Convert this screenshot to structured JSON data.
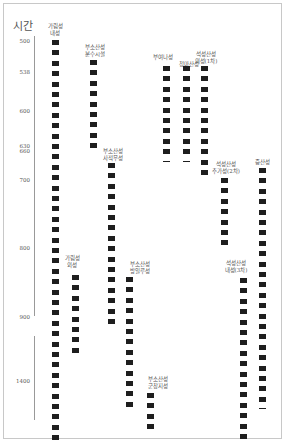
{
  "chart_data": {
    "type": "timeline",
    "title": "",
    "ylabel": "시간",
    "y_ticks": [
      "500",
      "538",
      "600",
      "630",
      "660",
      "700",
      "800",
      "900",
      "1400"
    ],
    "axis_break": "between 900 and 1400",
    "grid": false,
    "legend": null,
    "series": [
      {
        "name": "가림성 내성",
        "start": 500,
        "end": "~1450",
        "end_marker": "none"
      },
      {
        "name": "부소산성 분수시설",
        "start": 538,
        "end": 660,
        "end_marker": "none"
      },
      {
        "name": "부소산성 사적무성",
        "start": 670,
        "end": 900,
        "end_marker": "none"
      },
      {
        "name": "가림성 외성",
        "start": 840,
        "end": 920,
        "end_marker": "none"
      },
      {
        "name": "부소산성 방일루성",
        "start": 840,
        "end": "~1400",
        "end_marker": "none"
      },
      {
        "name": "부소산성 군창지성",
        "start": "~1410",
        "end": "~1450",
        "end_marker": "none"
      },
      {
        "name": "부여나성",
        "start": 538,
        "end": 660,
        "end_marker": "line"
      },
      {
        "name": "청마산성",
        "start": 538,
        "end": 660,
        "end_marker": "line"
      },
      {
        "name": "석성산성 외성(1차)",
        "start": 538,
        "end": 680,
        "end_marker": "none"
      },
      {
        "name": "석성산성 추가성(2차)",
        "start": 700,
        "end": 840,
        "end_marker": "none"
      },
      {
        "name": "석성산성 내성(3차)",
        "start": 850,
        "end": "~1450",
        "end_marker": "none"
      },
      {
        "name": "증산성",
        "start": 680,
        "end": "~1440",
        "end_marker": "line"
      }
    ]
  },
  "axis": {
    "title": "시간",
    "ticks": [
      {
        "label": "500",
        "y": 38
      },
      {
        "label": "538",
        "y": 69
      },
      {
        "label": "600",
        "y": 108
      },
      {
        "label": "630",
        "y": 143
      },
      {
        "label": "660",
        "y": 148
      },
      {
        "label": "700",
        "y": 177
      },
      {
        "label": "800",
        "y": 245
      },
      {
        "label": "900",
        "y": 314
      },
      {
        "label": "1400",
        "y": 378
      }
    ]
  },
  "columns": [
    {
      "label": "가림성\n내성",
      "x": 52,
      "label_x": 55,
      "label_y": 23,
      "start_y": 40,
      "count": 39,
      "end_line": false
    },
    {
      "label": "부소산성\n분수시설",
      "x": 90,
      "label_x": 95,
      "label_y": 44,
      "start_y": 60,
      "count": 9,
      "end_line": false
    },
    {
      "label": "부소산성\n사적무성",
      "x": 108,
      "label_x": 113,
      "label_y": 148,
      "start_y": 163,
      "count": 16,
      "end_line": false
    },
    {
      "label": "가림성\n외성",
      "x": 72,
      "label_x": 72,
      "label_y": 255,
      "start_y": 275,
      "count": 8,
      "end_line": false
    },
    {
      "label": "부소산성\n방일루성",
      "x": 126,
      "label_x": 140,
      "label_y": 261,
      "start_y": 277,
      "count": 13,
      "end_line": false
    },
    {
      "label": "부소산성\n군창지성",
      "x": 147,
      "label_x": 158,
      "label_y": 376,
      "start_y": 393,
      "count": 4,
      "end_line": false
    },
    {
      "label": "부여나성",
      "x": 163,
      "label_x": 163,
      "label_y": 54,
      "start_y": 66,
      "count": 9,
      "end_line": true
    },
    {
      "label": "청마산성",
      "x": 183,
      "label_x": 189,
      "label_y": 61,
      "start_y": 66,
      "count": 9,
      "end_line": true
    },
    {
      "label": "석성산성\n외성(1차)",
      "x": 201,
      "label_x": 206,
      "label_y": 51,
      "start_y": 66,
      "count": 11,
      "end_line": false
    },
    {
      "label": "석성산성\n추가성(2차)",
      "x": 221,
      "label_x": 226,
      "label_y": 161,
      "start_y": 178,
      "count": 7,
      "end_line": false
    },
    {
      "label": "석성산성\n내성(3차)",
      "x": 240,
      "label_x": 236,
      "label_y": 260,
      "start_y": 278,
      "count": 16,
      "end_line": false
    },
    {
      "label": "증산성",
      "x": 259,
      "label_x": 262,
      "label_y": 159,
      "start_y": 168,
      "count": 23,
      "end_line": true
    }
  ]
}
